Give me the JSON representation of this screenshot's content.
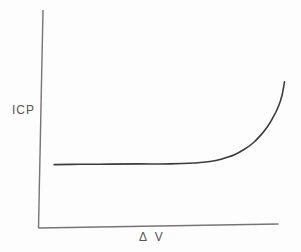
{
  "figure": {
    "background": "#fdfdfd",
    "axis_color": "#757575",
    "curve_color": "#3c3c3c",
    "label_color": "#555555"
  },
  "chart_data": {
    "type": "line",
    "title": "",
    "xlabel": "Δ V",
    "ylabel": "ICP",
    "x_ticks": [],
    "y_ticks": [],
    "axis_values_labeled": false,
    "legend": null,
    "grid": false,
    "series": [
      {
        "name": "ICP-volume curve",
        "units": "percent of axis length (axes are conceptual, no numeric scale shown)",
        "points": [
          [
            6.5,
            29.1
          ],
          [
            17.3,
            29.2
          ],
          [
            29.9,
            29.3
          ],
          [
            42.4,
            29.4
          ],
          [
            54.9,
            29.4
          ],
          [
            65.3,
            29.8
          ],
          [
            71.6,
            30.5
          ],
          [
            76.6,
            31.7
          ],
          [
            81.6,
            33.5
          ],
          [
            85.8,
            36.0
          ],
          [
            89.6,
            39.0
          ],
          [
            92.9,
            42.7
          ],
          [
            95.8,
            46.8
          ],
          [
            98.3,
            51.4
          ],
          [
            100.4,
            56.4
          ],
          [
            101.7,
            61.0
          ],
          [
            102.7,
            67.0
          ]
        ]
      }
    ]
  }
}
